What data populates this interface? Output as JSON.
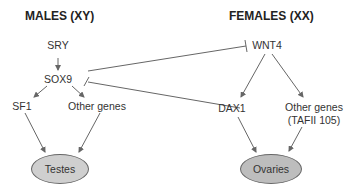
{
  "headers": {
    "males": "MALES (XY)",
    "females": "FEMALES (XX)"
  },
  "nodes": {
    "sry": "SRY",
    "sox9": "SOX9",
    "sf1": "SF1",
    "other_male": "Other genes",
    "testes": "Testes",
    "wnt4": "WNT4",
    "dax1": "DAX1",
    "other_female_1": "Other genes",
    "other_female_2": "(TAFII 105)",
    "ovaries": "Ovaries"
  },
  "colors": {
    "line": "#666666",
    "ellipse_fill": "#cfcfcf",
    "text": "#333333"
  }
}
